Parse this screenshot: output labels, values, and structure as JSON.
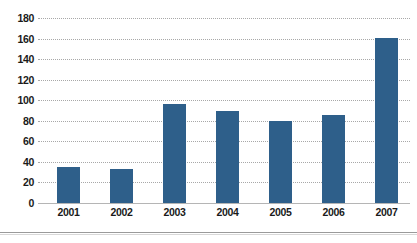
{
  "chart_data": {
    "type": "bar",
    "title": "",
    "subtitle": "",
    "xlabel": "",
    "ylabel": "",
    "categories": [
      "2001",
      "2002",
      "2003",
      "2004",
      "2005",
      "2006",
      "2007"
    ],
    "values": [
      35,
      33,
      96,
      90,
      80,
      86,
      161
    ],
    "series": [
      {
        "name": "",
        "values": [
          35,
          33,
          96,
          90,
          80,
          86,
          161
        ],
        "color": "#2e5f8a"
      }
    ],
    "ylim": [
      0,
      180
    ],
    "ytick_values": [
      0,
      20,
      40,
      60,
      80,
      100,
      120,
      140,
      160,
      180
    ],
    "ytick_labels": [
      "0",
      "20",
      "40",
      "60",
      "80",
      "100",
      "120",
      "140",
      "160",
      "180"
    ],
    "grid": true,
    "grid_axis": "y",
    "grid_style": "dotted",
    "grid_color": "#a8a8a8",
    "legend": false,
    "legend_position": "none",
    "background": "#ffffff",
    "annotations": []
  },
  "colors": {
    "bar_fill": "#2e5f8a",
    "grid": "#a8a8a8",
    "axis_line": "#b5b5b5",
    "text": "#1a1a1a",
    "rule": "#9a9a9a"
  }
}
